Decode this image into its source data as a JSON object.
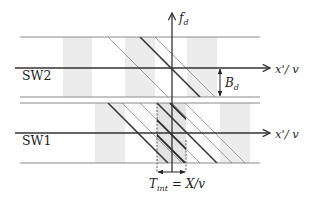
{
  "diagram": {
    "title": "",
    "colors": {
      "axis": "#333333",
      "band_line": "#8a8a8a",
      "stripe": "#ececec",
      "window": "#e6e6e6",
      "thin_diag": "#7a7a7a",
      "thick_diag": "#3a3a3a"
    },
    "labels": {
      "vertical_axis": "f",
      "vertical_axis_sub": "d",
      "sw2_axis": "x'/ v",
      "sw1_axis": "x'/ v",
      "sw2": "SW2",
      "sw1": "SW1",
      "bandwidth": "B",
      "bandwidth_sub": "d",
      "tint_main": "T",
      "tint_sub": "int",
      "tint_rhs": " = X/v"
    },
    "rows": [
      {
        "name": "SW2",
        "top": 37,
        "axis": 68,
        "bottom": 97
      },
      {
        "name": "SW1",
        "top": 103,
        "axis": 133,
        "bottom": 163
      }
    ],
    "stripes": [
      {
        "row": "SW2",
        "x1": 63,
        "x2": 92
      },
      {
        "row": "SW2",
        "x1": 125,
        "x2": 155
      },
      {
        "row": "SW2",
        "x1": 187,
        "x2": 217
      },
      {
        "row": "SW1",
        "x1": 95,
        "x2": 125
      },
      {
        "row": "SW1",
        "x1": 220,
        "x2": 250
      }
    ],
    "integration_window": {
      "x1": 157,
      "x2": 186,
      "y1": 103,
      "y2": 172
    },
    "diagonals": [
      {
        "row": "SW2",
        "x": 108,
        "weight": "thin"
      },
      {
        "row": "SW2",
        "x": 140,
        "weight": "thick"
      },
      {
        "row": "SW2",
        "x": 155,
        "weight": "thin"
      },
      {
        "row": "SW1",
        "x": 108,
        "weight": "thick"
      },
      {
        "row": "SW1",
        "x": 122,
        "weight": "thin"
      },
      {
        "row": "SW1",
        "x": 140,
        "weight": "thin"
      },
      {
        "row": "SW1",
        "x": 157,
        "weight": "thick"
      },
      {
        "row": "SW1",
        "x": 172,
        "weight": "thin"
      },
      {
        "row": "SW1",
        "x": 185,
        "weight": "thin"
      }
    ]
  }
}
